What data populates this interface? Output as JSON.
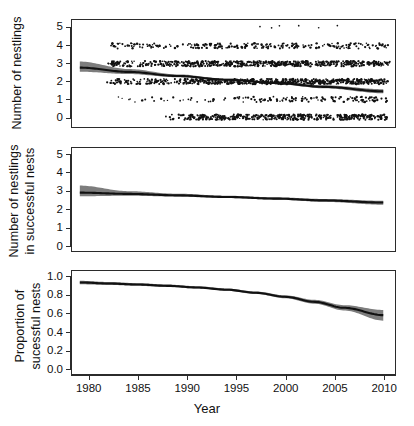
{
  "figure": {
    "panel_count": 3,
    "line_color": "#111111",
    "band_color": "#7d7d7d",
    "point_color": "#111111",
    "frame_color": "#2b2b2b"
  },
  "xaxis": {
    "title": "Year",
    "ticks": [
      1980,
      1985,
      1990,
      1995,
      2000,
      2005,
      2010
    ],
    "min": 1978.2,
    "max": 2011.2
  },
  "chart_data": [
    {
      "id": "panel-nestlings",
      "type": "scatter",
      "title": "",
      "xlabel": "Year",
      "ylabel": "Number of nestlings",
      "xlim": [
        1978.2,
        2011.2
      ],
      "ylim": [
        -0.55,
        5.45
      ],
      "yticks": [
        0,
        1,
        2,
        3,
        4,
        5
      ],
      "ytick_labels": [
        "0",
        "1",
        "2",
        "3",
        "4",
        "5"
      ],
      "grid": false,
      "legend": "none",
      "series": [
        {
          "name": "fitted trend",
          "type": "line",
          "x": [
            1979,
            1984,
            1989,
            1994,
            1999,
            2004,
            2010
          ],
          "values": [
            2.78,
            2.54,
            2.31,
            2.1,
            1.92,
            1.7,
            1.45
          ]
        },
        {
          "name": "95% confidence band",
          "type": "band",
          "x": [
            1979,
            1984,
            1989,
            1994,
            1999,
            2004,
            2010
          ],
          "lower": [
            2.55,
            2.42,
            2.24,
            2.05,
            1.86,
            1.62,
            1.34
          ],
          "upper": [
            3.12,
            2.7,
            2.4,
            2.16,
            1.99,
            1.79,
            1.57
          ]
        },
        {
          "name": "observed nests (jittered)",
          "type": "points",
          "note": "integer brood sizes 0-5 jittered vertically and horizontally",
          "levels": [
            0,
            1,
            2,
            3,
            4,
            5
          ],
          "counts_by_level": [
            470,
            150,
            640,
            600,
            240,
            6
          ]
        }
      ]
    },
    {
      "id": "panel-nestlings-successful",
      "type": "line",
      "title": "",
      "xlabel": "Year",
      "ylabel": "Number of nestlings in successful nests",
      "xlim": [
        1978.2,
        2011.2
      ],
      "ylim": [
        -0.3,
        5.4
      ],
      "yticks": [
        0,
        1,
        2,
        3,
        4,
        5
      ],
      "ytick_labels": [
        "0",
        "1",
        "2",
        "3",
        "4",
        "5"
      ],
      "grid": false,
      "legend": "none",
      "series": [
        {
          "name": "fitted trend",
          "type": "line",
          "x": [
            1979,
            1984,
            1989,
            1994,
            1999,
            2004,
            2010
          ],
          "values": [
            2.93,
            2.86,
            2.78,
            2.69,
            2.6,
            2.5,
            2.38
          ]
        },
        {
          "name": "95% confidence band",
          "type": "band",
          "x": [
            1979,
            1984,
            1989,
            1994,
            1999,
            2004,
            2010
          ],
          "lower": [
            2.73,
            2.76,
            2.71,
            2.63,
            2.54,
            2.42,
            2.26
          ],
          "upper": [
            3.32,
            3.01,
            2.87,
            2.76,
            2.67,
            2.58,
            2.48
          ]
        }
      ]
    },
    {
      "id": "panel-proportion-successful",
      "type": "line",
      "title": "",
      "xlabel": "Year",
      "ylabel": "Proportion of successful nests",
      "xlim": [
        1978.2,
        2011.2
      ],
      "ylim": [
        -0.055,
        1.07
      ],
      "yticks": [
        0.0,
        0.2,
        0.4,
        0.6,
        0.8,
        1.0
      ],
      "ytick_labels": [
        "0.0",
        "0.2",
        "0.4",
        "0.6",
        "0.8",
        "1.0"
      ],
      "grid": false,
      "legend": "none",
      "series": [
        {
          "name": "fitted trend",
          "type": "line",
          "x": [
            1979,
            1982,
            1985,
            1988,
            1991,
            1994,
            1997,
            2000,
            2003,
            2006,
            2010
          ],
          "values": [
            0.945,
            0.933,
            0.922,
            0.908,
            0.89,
            0.866,
            0.832,
            0.788,
            0.733,
            0.668,
            0.588
          ]
        },
        {
          "name": "95% confidence band",
          "type": "band",
          "x": [
            1979,
            1982,
            1985,
            1988,
            1991,
            1994,
            1997,
            2000,
            2003,
            2006,
            2010
          ],
          "lower": [
            0.925,
            0.918,
            0.908,
            0.895,
            0.878,
            0.854,
            0.819,
            0.772,
            0.712,
            0.639,
            0.528
          ],
          "upper": [
            0.963,
            0.95,
            0.937,
            0.922,
            0.903,
            0.879,
            0.846,
            0.804,
            0.755,
            0.697,
            0.645
          ]
        }
      ]
    }
  ],
  "panels": [
    {
      "ylabel": "Number of nestlings",
      "ylabel_line1": "Number of nestlings",
      "ylabel_line2": ""
    },
    {
      "ylabel": "Number of nestlings in successful nests",
      "ylabel_line1": "Number of nestlings",
      "ylabel_line2": "in successful nests"
    },
    {
      "ylabel": "Proportion of successful nests",
      "ylabel_line1": "Proportion of",
      "ylabel_line2": "sucessful nests"
    }
  ]
}
